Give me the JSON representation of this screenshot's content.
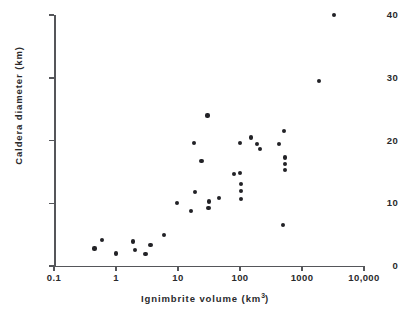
{
  "chart_data": {
    "type": "scatter",
    "title": "",
    "xlabel": "Ignimbrite volume (km3)",
    "xlabel_base": "Ignimbrite volume (km",
    "xlabel_exp": "3",
    "xlabel_tail": ")",
    "ylabel": "Caldera diameter (km)",
    "xscale": "log",
    "yscale": "linear",
    "xlim": [
      0.1,
      10000
    ],
    "ylim": [
      0,
      40
    ],
    "grid": false,
    "legend": null,
    "xticks": [
      0.1,
      1,
      10,
      100,
      1000,
      10000
    ],
    "xtick_labels": [
      "0.1",
      "1",
      "10",
      "100",
      "1000",
      "10,000"
    ],
    "yticks": [
      0,
      10,
      20,
      30,
      40
    ],
    "ytick_labels": [
      "0",
      "10",
      "20",
      "30",
      "40"
    ],
    "marker": "filled-circle",
    "marker_color": "#222226",
    "axis_color": "#55565a",
    "points": [
      {
        "x": 0.45,
        "y": 2.8
      },
      {
        "x": 0.6,
        "y": 4.2
      },
      {
        "x": 1.0,
        "y": 2.0
      },
      {
        "x": 1.9,
        "y": 3.9
      },
      {
        "x": 2.0,
        "y": 2.6
      },
      {
        "x": 3.0,
        "y": 1.9
      },
      {
        "x": 3.6,
        "y": 3.4
      },
      {
        "x": 6.0,
        "y": 4.9
      },
      {
        "x": 9.7,
        "y": 10.1
      },
      {
        "x": 16.0,
        "y": 8.8
      },
      {
        "x": 18.0,
        "y": 19.6
      },
      {
        "x": 19.0,
        "y": 11.8
      },
      {
        "x": 24.0,
        "y": 16.7
      },
      {
        "x": 30.0,
        "y": 24.0
      },
      {
        "x": 31.0,
        "y": 9.2
      },
      {
        "x": 32.0,
        "y": 10.3
      },
      {
        "x": 46.0,
        "y": 10.9
      },
      {
        "x": 80.0,
        "y": 14.7
      },
      {
        "x": 100.0,
        "y": 14.8
      },
      {
        "x": 100.0,
        "y": 19.6
      },
      {
        "x": 105.0,
        "y": 13.1
      },
      {
        "x": 105.0,
        "y": 12.0
      },
      {
        "x": 105.0,
        "y": 10.7
      },
      {
        "x": 150.0,
        "y": 20.5
      },
      {
        "x": 190.0,
        "y": 19.5
      },
      {
        "x": 210.0,
        "y": 18.6
      },
      {
        "x": 430.0,
        "y": 19.4
      },
      {
        "x": 520.0,
        "y": 21.5
      },
      {
        "x": 530.0,
        "y": 17.3
      },
      {
        "x": 530.0,
        "y": 16.3
      },
      {
        "x": 530.0,
        "y": 15.3
      },
      {
        "x": 500.0,
        "y": 6.6
      },
      {
        "x": 1900.0,
        "y": 29.5
      },
      {
        "x": 3300.0,
        "y": 40.0
      }
    ]
  }
}
